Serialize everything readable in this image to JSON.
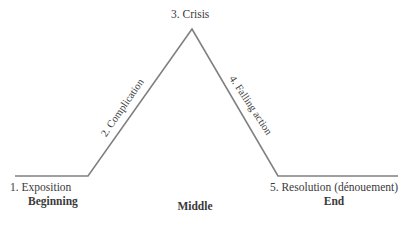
{
  "diagram": {
    "line_color": "#808080",
    "text_color": "#3a3a3a",
    "background_color": "#ffffff"
  },
  "labels": {
    "crisis": "3. Crisis",
    "complication": "2. Complication",
    "falling_action": "4. Falling action",
    "exposition": "1. Exposition",
    "resolution": "5. Resolution (dénouement)"
  },
  "stages": {
    "beginning": "Beginning",
    "middle": "Middle",
    "end": "End"
  },
  "chart_data": {
    "type": "line",
    "xlabel": "",
    "ylabel": "",
    "grid": false,
    "legend": "none",
    "points": [
      {
        "x": 15,
        "y": 176,
        "stage": "1. Exposition"
      },
      {
        "x": 88,
        "y": 176,
        "stage": "start of rising action"
      },
      {
        "x": 192,
        "y": 29,
        "stage": "3. Crisis"
      },
      {
        "x": 278,
        "y": 176,
        "stage": "end of falling action"
      },
      {
        "x": 398,
        "y": 176,
        "stage": "5. Resolution (dénouement)"
      }
    ],
    "segments": [
      {
        "name": "1. Exposition",
        "from": [
          15,
          176
        ],
        "to": [
          88,
          176
        ]
      },
      {
        "name": "2. Complication",
        "from": [
          88,
          176
        ],
        "to": [
          192,
          29
        ]
      },
      {
        "name": "4. Falling action",
        "from": [
          192,
          29
        ],
        "to": [
          278,
          176
        ]
      },
      {
        "name": "5. Resolution (dénouement)",
        "from": [
          278,
          176
        ],
        "to": [
          398,
          176
        ]
      }
    ]
  }
}
